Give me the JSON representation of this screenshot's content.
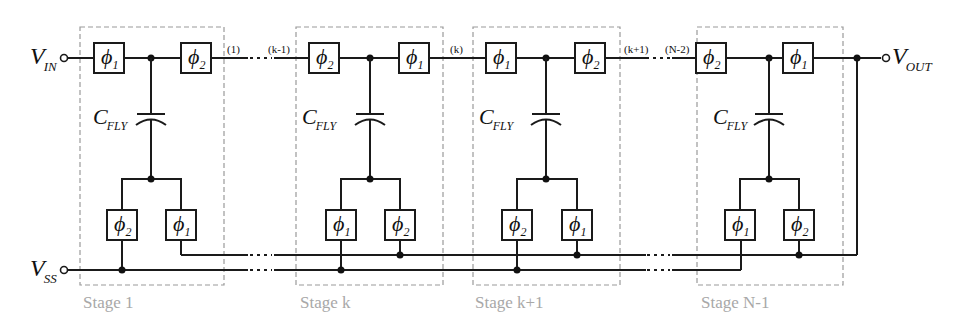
{
  "diagram": {
    "terminals": {
      "vin": {
        "label": "V",
        "sub": "IN"
      },
      "vout": {
        "label": "V",
        "sub": "OUT"
      },
      "vss": {
        "label": "V",
        "sub": "SS"
      }
    },
    "capacitor_label": {
      "main": "C",
      "sub": "FLY"
    },
    "node_labels": [
      "(1)",
      "(k-1)",
      "(k)",
      "(k+1)",
      "(N-2)"
    ],
    "stages": [
      {
        "label": "Stage 1",
        "top_left": {
          "sym": "ϕ",
          "sub": "1"
        },
        "top_right": {
          "sym": "ϕ",
          "sub": "2"
        },
        "bot_left": {
          "sym": "ϕ",
          "sub": "2"
        },
        "bot_right": {
          "sym": "ϕ",
          "sub": "1"
        }
      },
      {
        "label": "Stage k",
        "top_left": {
          "sym": "ϕ",
          "sub": "2"
        },
        "top_right": {
          "sym": "ϕ",
          "sub": "1"
        },
        "bot_left": {
          "sym": "ϕ",
          "sub": "1"
        },
        "bot_right": {
          "sym": "ϕ",
          "sub": "2"
        }
      },
      {
        "label": "Stage k+1",
        "top_left": {
          "sym": "ϕ",
          "sub": "1"
        },
        "top_right": {
          "sym": "ϕ",
          "sub": "2"
        },
        "bot_left": {
          "sym": "ϕ",
          "sub": "2"
        },
        "bot_right": {
          "sym": "ϕ",
          "sub": "1"
        }
      },
      {
        "label": "Stage N-1",
        "top_left": {
          "sym": "ϕ",
          "sub": "2"
        },
        "top_right": {
          "sym": "ϕ",
          "sub": "1"
        },
        "bot_left": {
          "sym": "ϕ",
          "sub": "1"
        },
        "bot_right": {
          "sym": "ϕ",
          "sub": "2"
        }
      }
    ],
    "continuation": "···"
  }
}
